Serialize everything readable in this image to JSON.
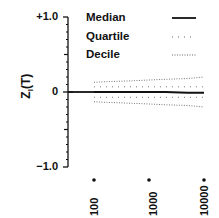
{
  "chart_data": {
    "type": "line",
    "title": "",
    "xlabel": "",
    "ylabel": "Z_l(T)",
    "ylim": [
      -1.0,
      1.0
    ],
    "xscale": "log",
    "x_ticks": [
      "100",
      "1000",
      "10000"
    ],
    "y_ticks": [
      "+1.0",
      "0",
      "−1.0"
    ],
    "grid": false,
    "legend_position": "upper right",
    "x": [
      100,
      200,
      500,
      1000,
      2000,
      5000,
      10000
    ],
    "series": [
      {
        "name": "Median",
        "style": "solid",
        "values": [
          0.0,
          0.0,
          0.0,
          0.0,
          0.0,
          -0.01,
          -0.01
        ]
      },
      {
        "name": "Quartile upper",
        "legend": "Quartile",
        "style": "sparse-dotted",
        "values": [
          0.07,
          0.07,
          0.07,
          0.07,
          0.07,
          0.07,
          0.07
        ]
      },
      {
        "name": "Quartile lower",
        "legend": "Quartile",
        "style": "sparse-dotted",
        "values": [
          -0.07,
          -0.07,
          -0.07,
          -0.07,
          -0.07,
          -0.07,
          -0.07
        ]
      },
      {
        "name": "Decile upper",
        "legend": "Decile",
        "style": "dense-dotted",
        "values": [
          0.13,
          0.14,
          0.15,
          0.16,
          0.17,
          0.18,
          0.2
        ]
      },
      {
        "name": "Decile lower",
        "legend": "Decile",
        "style": "dense-dotted",
        "values": [
          -0.13,
          -0.14,
          -0.15,
          -0.16,
          -0.17,
          -0.18,
          -0.2
        ]
      }
    ]
  },
  "axis": {
    "ylabel_main": "Z",
    "ylabel_sub": "l",
    "ylabel_arg": "(T)",
    "y_top": "+1.0",
    "y_mid": "0",
    "y_bottom": "−1.0",
    "x_ticks": [
      "100",
      "1000",
      "10000"
    ]
  },
  "legend": {
    "items": [
      {
        "label": "Median"
      },
      {
        "label": "Quartile"
      },
      {
        "label": "Decile"
      }
    ]
  }
}
